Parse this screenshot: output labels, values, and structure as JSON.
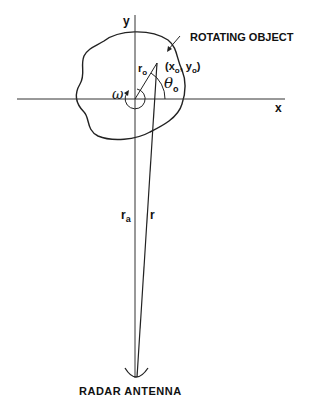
{
  "diagram": {
    "labels": {
      "y_axis": "y",
      "x_axis": "x",
      "object": "ROTATING OBJECT",
      "point": "(x",
      "point_sub_x": "o",
      "point_mid": ", y",
      "point_sub_y": "o",
      "point_close": ")",
      "r_o": "r",
      "r_o_sub": "o",
      "theta": "θ",
      "theta_sub": "o",
      "omega": "ω",
      "r_a": "r",
      "r_a_sub": "a",
      "r": "r",
      "antenna": "RADAR ANTENNA"
    },
    "colors": {
      "line": "#222222",
      "background": "#ffffff"
    }
  }
}
